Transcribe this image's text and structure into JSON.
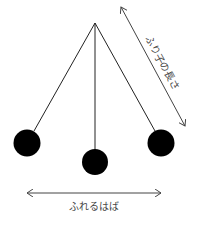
{
  "diagram": {
    "labels": {
      "length": "ふり子の長さ",
      "amplitude": "ふれるはば"
    },
    "colors": {
      "line": "#222222",
      "bob": "#000000",
      "arrow": "#444444",
      "text": "#444444",
      "background": "#ffffff"
    },
    "pivot": {
      "x": 95,
      "y": 23
    },
    "bobs": [
      {
        "name": "left",
        "x": 27,
        "y": 143,
        "r": 13
      },
      {
        "name": "center",
        "x": 95,
        "y": 162,
        "r": 13
      },
      {
        "name": "right",
        "x": 161,
        "y": 143,
        "r": 13
      }
    ]
  }
}
